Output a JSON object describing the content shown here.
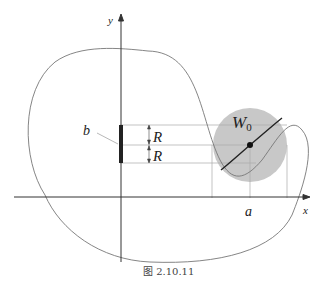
{
  "figure": {
    "caption": "图 2.10.11",
    "labels": {
      "y_axis": "y",
      "x_axis": "x",
      "segment_b": "b",
      "radius_upper": "R",
      "radius_lower": "R",
      "neighborhood": "W",
      "neighborhood_subscript": "0",
      "point_a": "a"
    },
    "colors": {
      "disk_fill": "#c8c8c8",
      "axis": "#333333",
      "curve": "#777777",
      "guide": "#aaaaaa",
      "segment": "#222222"
    }
  }
}
